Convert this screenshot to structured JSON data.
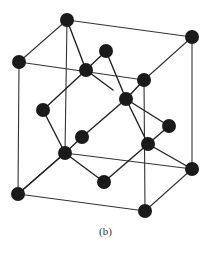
{
  "figure": {
    "caption": "(b)",
    "colors": {
      "atom": "#1a1a1a",
      "edge": "#333333",
      "bond": "#222222",
      "background": "#ffffff"
    },
    "atom_radius": 7,
    "atoms": [
      {
        "id": "corner-top-back-left",
        "x": 67,
        "y": 20
      },
      {
        "id": "corner-top-back-right",
        "x": 192,
        "y": 37
      },
      {
        "id": "corner-top-front-left",
        "x": 19,
        "y": 62
      },
      {
        "id": "corner-top-front-right",
        "x": 144,
        "y": 80
      },
      {
        "id": "corner-bottom-back-left",
        "x": 65,
        "y": 153
      },
      {
        "id": "corner-bottom-back-right",
        "x": 192,
        "y": 169
      },
      {
        "id": "corner-bottom-front-left",
        "x": 18,
        "y": 194
      },
      {
        "id": "corner-bottom-front-right",
        "x": 145,
        "y": 211
      },
      {
        "id": "face-center-top",
        "x": 86,
        "y": 70
      },
      {
        "id": "face-atom-upper",
        "x": 106,
        "y": 51
      },
      {
        "id": "interior-center",
        "x": 126,
        "y": 99
      },
      {
        "id": "face-atom-left",
        "x": 43,
        "y": 110
      },
      {
        "id": "interior-left",
        "x": 82,
        "y": 137
      },
      {
        "id": "face-atom-right",
        "x": 169,
        "y": 126
      },
      {
        "id": "interior-right",
        "x": 148,
        "y": 144
      },
      {
        "id": "face-atom-bottom",
        "x": 104,
        "y": 182
      }
    ],
    "cube_edges": [
      [
        67,
        20,
        192,
        37
      ],
      [
        19,
        62,
        144,
        80
      ],
      [
        67,
        20,
        19,
        62
      ],
      [
        192,
        37,
        144,
        80
      ],
      [
        65,
        153,
        192,
        169
      ],
      [
        18,
        194,
        145,
        211
      ],
      [
        65,
        153,
        18,
        194
      ],
      [
        192,
        169,
        145,
        211
      ],
      [
        67,
        20,
        65,
        153
      ],
      [
        192,
        37,
        192,
        169
      ],
      [
        19,
        62,
        18,
        194
      ],
      [
        144,
        80,
        145,
        211
      ]
    ],
    "bonds": [
      [
        67,
        20,
        86,
        70
      ],
      [
        86,
        70,
        106,
        51
      ],
      [
        86,
        70,
        43,
        110
      ],
      [
        86,
        70,
        113,
        90
      ],
      [
        106,
        51,
        126,
        99
      ],
      [
        144,
        80,
        126,
        99
      ],
      [
        126,
        99,
        82,
        137
      ],
      [
        126,
        99,
        169,
        126
      ],
      [
        126,
        99,
        148,
        144
      ],
      [
        43,
        110,
        65,
        153
      ],
      [
        82,
        137,
        65,
        153
      ],
      [
        65,
        153,
        18,
        194
      ],
      [
        65,
        153,
        104,
        182
      ],
      [
        169,
        126,
        148,
        144
      ],
      [
        148,
        144,
        192,
        169
      ],
      [
        148,
        144,
        104,
        182
      ]
    ]
  }
}
